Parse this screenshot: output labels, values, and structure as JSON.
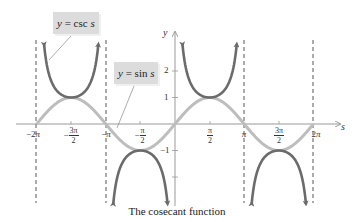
{
  "chart_data": {
    "type": "line",
    "title": "",
    "caption": "The cosecant function",
    "xlabel": "s",
    "ylabel": "y",
    "xlim": [
      -6.9,
      7.5
    ],
    "ylim": [
      -3.1,
      3.2
    ],
    "x_ticks": [
      "-2π",
      "-3π/2",
      "-π",
      "-π/2",
      "π/2",
      "π",
      "3π/2",
      "2π"
    ],
    "x_tick_values": [
      -6.2832,
      -4.7124,
      -3.1416,
      -1.5708,
      1.5708,
      3.1416,
      4.7124,
      6.2832
    ],
    "y_ticks": [
      "-2",
      "-1",
      "1",
      "2"
    ],
    "y_tick_values": [
      -2,
      -1,
      1,
      2
    ],
    "asymptotes": [
      -6.2832,
      -3.1416,
      3.1416,
      6.2832
    ],
    "series": [
      {
        "name": "y = csc s",
        "color": "#6b6b6b",
        "function": "csc",
        "domain": [
          -6.2832,
          6.2832
        ]
      },
      {
        "name": "y = sin s",
        "color": "#bdbdbd",
        "function": "sin",
        "domain": [
          -6.2832,
          6.2832
        ]
      }
    ],
    "annotations": [
      {
        "text": "y = csc s",
        "points_to": "csc branch on (-2π, -π)"
      },
      {
        "text": "y = sin s",
        "points_to": "sin curve near -π"
      }
    ],
    "grid": false
  },
  "labels": {
    "csc": {
      "italic": "y",
      "eq": " = ",
      "fn": "csc",
      "var": " s"
    },
    "sin": {
      "italic": "y",
      "eq": " = ",
      "fn": "sin",
      "var": " s"
    }
  },
  "axes": {
    "x_name": "s",
    "y_name": "y",
    "x_ticks": {
      "neg2pi": {
        "pre": "−2",
        "pi": "π"
      },
      "neg3pi2": {
        "sign": "−",
        "num": "3π",
        "den": "2"
      },
      "negpi": {
        "pre": "−",
        "pi": "π"
      },
      "negpi2": {
        "sign": "−",
        "num": "π",
        "den": "2"
      },
      "pi2": {
        "num": "π",
        "den": "2"
      },
      "pi": {
        "pi": "π"
      },
      "pi32": {
        "num": "3π",
        "den": "2"
      },
      "twopi": {
        "pre": "2",
        "pi": "π"
      }
    },
    "y_ticks": {
      "p2": "2",
      "p1": "1",
      "m1": "−1"
    }
  },
  "caption": "The cosecant function"
}
